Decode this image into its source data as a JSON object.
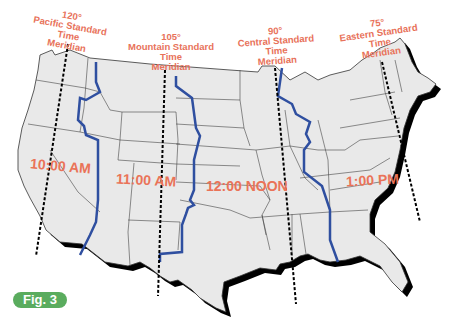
{
  "figure_label": "Fig. 3",
  "colors": {
    "label": "#e8725a",
    "zone_boundary": "#2f4fa0",
    "land": "#e8e8e8",
    "shadow": "#000000",
    "fig_badge": "#5aac5e"
  },
  "meridians": [
    {
      "degree": "120°",
      "line1": "Pacific Standard",
      "line2": "Time",
      "line3": "Meridian"
    },
    {
      "degree": "105°",
      "line1": "Mountain Standard",
      "line2": "Time",
      "line3": "Meridian"
    },
    {
      "degree": "90°",
      "line1": "Central Standard",
      "line2": "Time",
      "line3": "Meridian"
    },
    {
      "degree": "75°",
      "line1": "Eastern Standard",
      "line2": "Time",
      "line3": "Meridian"
    }
  ],
  "zones": [
    {
      "time": "10:00 AM"
    },
    {
      "time": "11:00 AM"
    },
    {
      "time": "12:00 NOON"
    },
    {
      "time": "1:00 PM"
    }
  ]
}
